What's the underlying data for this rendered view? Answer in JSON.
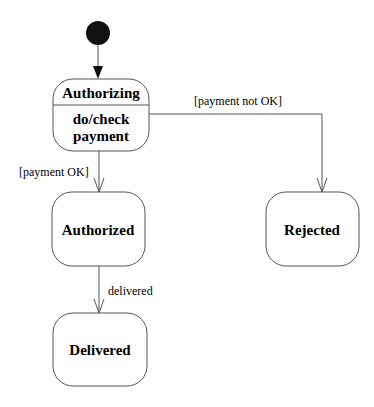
{
  "diagram": {
    "type": "uml-state-machine",
    "initial_state": {
      "label": ""
    },
    "states": [
      {
        "id": "authorizing",
        "name": "Authorizing",
        "activity_line1": "do/check",
        "activity_line2": "payment"
      },
      {
        "id": "authorized",
        "name": "Authorized"
      },
      {
        "id": "rejected",
        "name": "Rejected"
      },
      {
        "id": "delivered",
        "name": "Delivered"
      }
    ],
    "transitions": [
      {
        "from": "initial",
        "to": "authorizing",
        "label": ""
      },
      {
        "from": "authorizing",
        "to": "authorized",
        "label": "[payment OK]"
      },
      {
        "from": "authorizing",
        "to": "rejected",
        "label": "[payment not OK]"
      },
      {
        "from": "authorized",
        "to": "delivered",
        "label": "delivered"
      }
    ],
    "colors": {
      "stroke": "#555555",
      "text": "#1a1a1a",
      "initial_fill": "#111111"
    }
  }
}
